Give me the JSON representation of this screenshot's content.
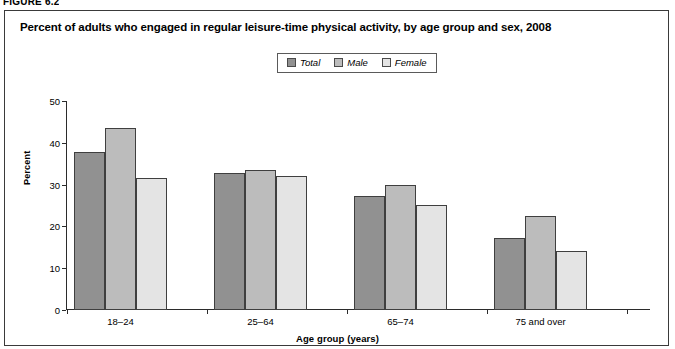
{
  "figure": {
    "number_label": "FIGURE 6.2",
    "title": "Percent of adults who engaged in regular leisure-time physical activity, by age group and sex, 2008"
  },
  "legend": {
    "items": [
      {
        "label": "Total",
        "color": "#919191"
      },
      {
        "label": "Male",
        "color": "#bcbcbc"
      },
      {
        "label": "Female",
        "color": "#e4e4e4"
      }
    ]
  },
  "axes": {
    "y_ticks": [
      "0",
      "10",
      "20",
      "30",
      "40",
      "50"
    ],
    "y_title": "Percent",
    "x_title": "Age group (years)"
  },
  "chart_data": {
    "type": "bar",
    "title": "Percent of adults who engaged in regular leisure-time physical activity, by age group and sex, 2008",
    "xlabel": "Age group (years)",
    "ylabel": "Percent",
    "ylim": [
      0,
      50
    ],
    "ytick_step": 10,
    "grid": false,
    "legend_position": "top-center",
    "categories": [
      "18–24",
      "25–64",
      "65–74",
      "75 and over"
    ],
    "series": [
      {
        "name": "Total",
        "color": "#919191",
        "values": [
          37.7,
          32.7,
          27.3,
          17.3
        ]
      },
      {
        "name": "Male",
        "color": "#bcbcbc",
        "values": [
          43.5,
          33.6,
          30.0,
          22.6
        ]
      },
      {
        "name": "Female",
        "color": "#e4e4e4",
        "values": [
          31.5,
          32.0,
          25.1,
          14.0
        ]
      }
    ]
  }
}
